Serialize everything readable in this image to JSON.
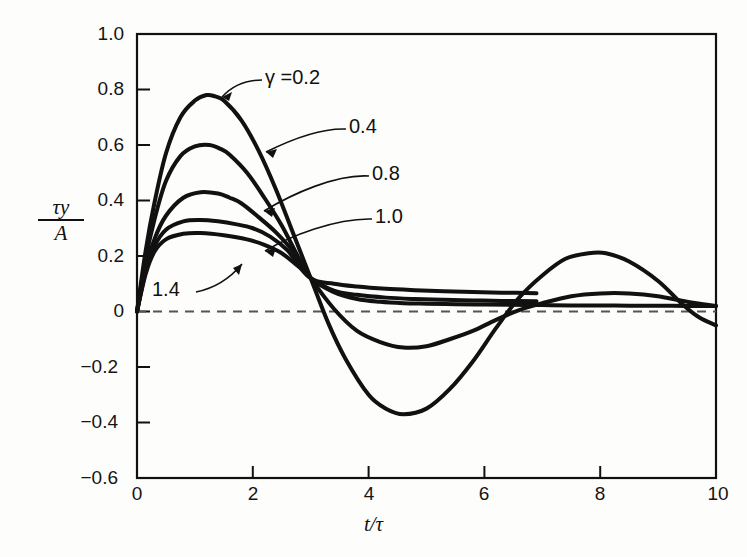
{
  "figure": {
    "background": "#fdfdfb",
    "ink_color": "#111111"
  },
  "chart_data": {
    "type": "line",
    "title": "",
    "xlabel": "t/τ",
    "ylabel": "τy/A",
    "ylabel_numerator": "τy",
    "ylabel_denominator": "A",
    "xlim": [
      0,
      10
    ],
    "ylim": [
      -0.6,
      1.0
    ],
    "grid": false,
    "legend_position": "inline-annotations",
    "zero_line": {
      "style": "dashed",
      "value": 0
    },
    "xticks": [
      0,
      2,
      4,
      6,
      8,
      10
    ],
    "xtick_labels": [
      "0",
      "2",
      "4",
      "6",
      "8",
      "10"
    ],
    "yticks": [
      1.0,
      0.8,
      0.6,
      0.4,
      0.2,
      0,
      -0.2,
      -0.4,
      -0.6
    ],
    "ytick_labels": [
      "1.0",
      "0.8",
      "0.6",
      "0.4",
      "0.2",
      "0",
      "−0.2",
      "−0.4",
      "−0.6"
    ],
    "series": [
      {
        "name": "γ = 0.2",
        "gamma": 0.2,
        "label": "γ =0.2",
        "x": [
          0,
          0.15,
          0.3,
          0.5,
          0.75,
          1.0,
          1.2,
          1.35,
          1.5,
          1.8,
          2.1,
          2.4,
          2.7,
          3.0,
          3.3,
          3.6,
          4.0,
          4.3,
          4.6,
          5.0,
          5.4,
          5.8,
          6.2,
          6.6,
          7.0,
          7.4,
          7.8,
          8.1,
          8.5,
          9.0,
          9.4,
          9.7,
          10.0
        ],
        "y": [
          0,
          0.22,
          0.39,
          0.57,
          0.7,
          0.76,
          0.78,
          0.775,
          0.76,
          0.69,
          0.58,
          0.44,
          0.28,
          0.12,
          -0.04,
          -0.17,
          -0.3,
          -0.35,
          -0.37,
          -0.35,
          -0.28,
          -0.18,
          -0.06,
          0.05,
          0.13,
          0.19,
          0.21,
          0.21,
          0.18,
          0.11,
          0.03,
          -0.02,
          -0.05
        ]
      },
      {
        "name": "0.4",
        "gamma": 0.4,
        "label": "0.4",
        "x": [
          0,
          0.15,
          0.3,
          0.5,
          0.75,
          1.0,
          1.25,
          1.45,
          1.6,
          1.9,
          2.2,
          2.5,
          2.8,
          3.0,
          3.4,
          3.8,
          4.2,
          4.6,
          5.0,
          5.4,
          5.8,
          6.2,
          6.6,
          7.0,
          7.5,
          8.0,
          8.5,
          9.0,
          9.5,
          10.0
        ],
        "y": [
          0,
          0.19,
          0.33,
          0.47,
          0.56,
          0.595,
          0.6,
          0.585,
          0.565,
          0.5,
          0.41,
          0.31,
          0.19,
          0.12,
          0.01,
          -0.07,
          -0.11,
          -0.13,
          -0.125,
          -0.1,
          -0.07,
          -0.03,
          0.005,
          0.03,
          0.055,
          0.065,
          0.065,
          0.055,
          0.035,
          0.02
        ]
      },
      {
        "name": "0.8",
        "gamma": 0.8,
        "label": "0.8",
        "x": [
          0,
          0.15,
          0.3,
          0.5,
          0.8,
          1.1,
          1.4,
          1.6,
          1.8,
          2.1,
          2.4,
          2.7,
          3.0,
          3.4,
          3.8,
          4.2,
          4.6,
          5.0,
          5.5,
          6.0,
          6.5,
          7.0,
          7.5,
          8.0,
          8.5,
          9.0,
          9.5,
          10.0
        ],
        "y": [
          0,
          0.155,
          0.26,
          0.345,
          0.41,
          0.43,
          0.425,
          0.41,
          0.39,
          0.34,
          0.285,
          0.215,
          0.12,
          0.07,
          0.045,
          0.035,
          0.03,
          0.028,
          0.026,
          0.025,
          0.024,
          0.023,
          0.022,
          0.022,
          0.021,
          0.021,
          0.02,
          0.02
        ]
      },
      {
        "name": "1.0",
        "gamma": 1.0,
        "label": "1.0",
        "x": [
          0,
          0.15,
          0.3,
          0.5,
          0.8,
          1.1,
          1.4,
          1.7,
          2.0,
          2.3,
          2.6,
          3.0,
          3.4,
          3.8,
          4.3,
          4.8,
          5.3,
          5.8,
          6.3,
          6.9
        ],
        "y": [
          0,
          0.145,
          0.235,
          0.295,
          0.325,
          0.33,
          0.325,
          0.315,
          0.3,
          0.27,
          0.22,
          0.12,
          0.1,
          0.09,
          0.082,
          0.077,
          0.073,
          0.07,
          0.068,
          0.066
        ],
        "truncated_at_x": 6.9
      },
      {
        "name": "1.4",
        "gamma": 1.4,
        "label": "1.4",
        "x": [
          0,
          0.15,
          0.3,
          0.5,
          0.8,
          1.1,
          1.5,
          1.9,
          2.2,
          2.5,
          2.8,
          3.0,
          3.4,
          3.8,
          4.3,
          4.8,
          5.3,
          5.8,
          6.3,
          6.9
        ],
        "y": [
          0,
          0.135,
          0.215,
          0.26,
          0.28,
          0.283,
          0.275,
          0.26,
          0.24,
          0.21,
          0.16,
          0.12,
          0.075,
          0.06,
          0.05,
          0.045,
          0.042,
          0.04,
          0.038,
          0.037
        ],
        "truncated_at_x": 6.9
      }
    ],
    "annotations": [
      {
        "text": "γ =0.2",
        "kind": "gamma-label",
        "points_to_series": "0.2"
      },
      {
        "text": "0.4",
        "kind": "value-label",
        "points_to_series": "0.4"
      },
      {
        "text": "0.8",
        "kind": "value-label",
        "points_to_series": "0.8"
      },
      {
        "text": "1.0",
        "kind": "value-label",
        "points_to_series": "1.0"
      },
      {
        "text": "1.4",
        "kind": "value-label",
        "points_to_series": "1.4"
      }
    ]
  }
}
